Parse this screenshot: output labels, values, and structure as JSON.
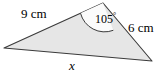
{
  "figure": {
    "type": "triangle-diagram",
    "fill_color": "#e6e6e6",
    "stroke_color": "#3a3a3a",
    "angle_arc_fill": "#fbfbfb",
    "background_color": "#ffffff",
    "vertices": {
      "left": {
        "x": 4,
        "y": 48
      },
      "top": {
        "x": 103,
        "y": 3
      },
      "right": {
        "x": 152,
        "y": 61
      }
    },
    "labels": {
      "side_a": "9 cm",
      "side_b": "6 cm",
      "angle_value": "105",
      "angle_degree_symbol": "°",
      "base_unknown": "x"
    }
  }
}
